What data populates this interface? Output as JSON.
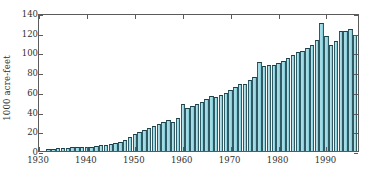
{
  "chart_data": {
    "type": "bar",
    "title": "",
    "subtitle": "",
    "xlabel": "",
    "ylabel": "1000 acre-feet",
    "xlim": [
      1930,
      1997
    ],
    "ylim": [
      0,
      140
    ],
    "grid": false,
    "legend": null,
    "annotations": [],
    "xticks": [
      1930,
      1940,
      1950,
      1960,
      1970,
      1980,
      1990
    ],
    "xticklabels": [
      "1930",
      "1940",
      "1950",
      "1960",
      "1970",
      "1980",
      "1990"
    ],
    "yticks": [
      0,
      20,
      40,
      60,
      80,
      100,
      120,
      140
    ],
    "yticklabels": [
      "0",
      "20",
      "40",
      "60",
      "80",
      "100",
      "120",
      "140"
    ],
    "bar_color": "#9ed9e3",
    "bar_edge_color": "#1d3f47",
    "axis_color": "#5b5b5b",
    "categories": [
      1932,
      1933,
      1934,
      1935,
      1936,
      1937,
      1938,
      1939,
      1940,
      1941,
      1942,
      1943,
      1944,
      1945,
      1946,
      1947,
      1948,
      1949,
      1950,
      1951,
      1952,
      1953,
      1954,
      1955,
      1956,
      1957,
      1958,
      1959,
      1960,
      1961,
      1962,
      1963,
      1964,
      1965,
      1966,
      1967,
      1968,
      1969,
      1970,
      1971,
      1972,
      1973,
      1974,
      1975,
      1976,
      1977,
      1978,
      1979,
      1980,
      1981,
      1982,
      1983,
      1984,
      1985,
      1986,
      1987,
      1988,
      1989,
      1990,
      1991,
      1992,
      1993,
      1994,
      1995,
      1996
    ],
    "values": [
      2,
      2.5,
      3,
      3.2,
      3.5,
      3.8,
      4,
      4.2,
      4.5,
      4.5,
      5,
      6,
      6.5,
      7,
      8,
      9.5,
      11,
      14,
      17,
      19,
      21,
      23,
      25,
      27,
      29,
      31,
      29.5,
      34,
      48,
      44,
      46,
      48,
      50,
      53,
      56,
      55,
      57,
      59,
      62,
      65,
      68,
      68,
      72,
      75,
      90,
      86,
      87,
      87,
      89,
      91,
      94,
      97,
      100,
      101,
      105,
      108,
      113,
      130,
      117,
      108,
      112,
      122,
      122,
      124,
      118
    ],
    "units": "1000 acre-feet",
    "series": [
      {
        "name": "annual volume",
        "values": [
          2,
          2.5,
          3,
          3.2,
          3.5,
          3.8,
          4,
          4.2,
          4.5,
          4.5,
          5,
          6,
          6.5,
          7,
          8,
          9.5,
          11,
          14,
          17,
          19,
          21,
          23,
          25,
          27,
          29,
          31,
          29.5,
          34,
          48,
          44,
          46,
          48,
          50,
          53,
          56,
          55,
          57,
          59,
          62,
          65,
          68,
          68,
          72,
          75,
          90,
          86,
          87,
          87,
          89,
          91,
          94,
          97,
          100,
          101,
          105,
          108,
          113,
          130,
          117,
          108,
          112,
          122,
          122,
          124,
          118
        ]
      }
    ]
  }
}
